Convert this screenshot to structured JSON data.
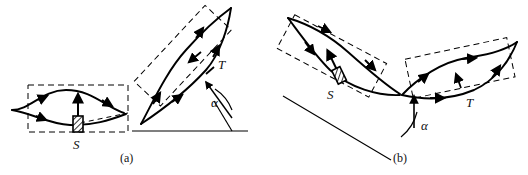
{
  "figure": {
    "type": "line-diagram",
    "background": "#ffffff",
    "stroke_color": "#000000",
    "panels": [
      {
        "id": "a",
        "caption": "(a)",
        "labels": {
          "source": "S",
          "target": "T",
          "angle": "α"
        }
      },
      {
        "id": "b",
        "caption": "(b)",
        "labels": {
          "source": "S",
          "target": "T",
          "angle": "α"
        }
      }
    ]
  },
  "panel_a": {
    "caption": "(a)",
    "label_s": "S",
    "label_t": "T",
    "label_alpha": "α"
  },
  "panel_b": {
    "caption": "(b)",
    "label_s": "S",
    "label_t": "T",
    "label_alpha": "α"
  }
}
